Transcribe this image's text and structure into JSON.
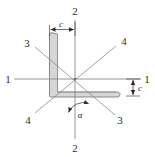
{
  "figure": {
    "type": "engineering-cross-section-diagram",
    "background_color": "#ffffff",
    "section": {
      "name": "angle-section",
      "fill_color": "#d6d6d6",
      "stroke_color": "#6e6e6e"
    }
  },
  "axes": {
    "axis_1": {
      "name": "axis-1-1",
      "orientation": "horizontal",
      "label": "1",
      "label_left": "1",
      "label_right": "1",
      "color": "#8a8a8a"
    },
    "axis_2": {
      "name": "axis-2-2",
      "orientation": "vertical",
      "label": "2",
      "label_top": "2",
      "label_bottom": "2",
      "color": "#8a8a8a"
    },
    "axis_3": {
      "name": "axis-3-3",
      "orientation": "diagonal-down-right",
      "label": "3",
      "label_upper_left": "3",
      "label_lower_right": "3",
      "color": "#8a8a8a"
    },
    "axis_4": {
      "name": "axis-4-4",
      "orientation": "diagonal-up-right",
      "label": "4",
      "label_upper_right": "4",
      "label_lower_left": "4",
      "color": "#8a8a8a"
    }
  },
  "dimensions": {
    "horizontal_c": {
      "label": "c",
      "position": "top",
      "color": "#2b2b2b"
    },
    "vertical_c": {
      "label": "c",
      "position": "right",
      "color": "#2b2b2b"
    }
  },
  "angle": {
    "label": "α",
    "name": "principal-axis-angle",
    "between": "axis-2 and axis-3",
    "color": "#2b2b2b"
  }
}
